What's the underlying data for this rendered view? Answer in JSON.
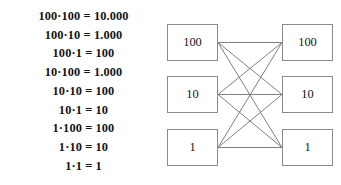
{
  "equations": {
    "lines": [
      "100·100 = 10.000",
      "100·10 = 1.000",
      "100·1 = 100",
      "10·100 = 1.000",
      "10·10 = 100",
      "10·1 = 10",
      "1·100 = 100",
      "1·10 = 10",
      "1·1 = 1"
    ]
  },
  "diagram": {
    "left_nodes": [
      {
        "label": "100"
      },
      {
        "label": "10"
      },
      {
        "label": "1"
      }
    ],
    "right_nodes": [
      {
        "label": "100"
      },
      {
        "label": "10"
      },
      {
        "label": "1"
      }
    ],
    "edges": [
      {
        "from": 0,
        "to": 0
      },
      {
        "from": 0,
        "to": 1
      },
      {
        "from": 0,
        "to": 2
      },
      {
        "from": 1,
        "to": 0
      },
      {
        "from": 1,
        "to": 1
      },
      {
        "from": 1,
        "to": 2
      },
      {
        "from": 2,
        "to": 0
      },
      {
        "from": 2,
        "to": 1
      },
      {
        "from": 2,
        "to": 2
      }
    ]
  },
  "colors": {
    "background": "#ffffff",
    "text": "#141414",
    "line": "#808080",
    "box_border": "#8a8a8a"
  }
}
